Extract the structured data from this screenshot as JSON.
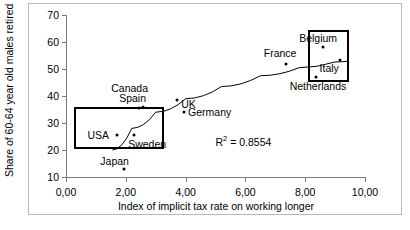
{
  "chart_data": {
    "type": "scatter",
    "title": "",
    "xlabel": "Index of implicit tax rate on working longer",
    "ylabel": "Share of 60-64 year old males retired",
    "xlim": [
      0,
      10
    ],
    "ylim": [
      10,
      70
    ],
    "xticks": [
      "0,00",
      "2,00",
      "4,00",
      "6,00",
      "8,00",
      "10,00"
    ],
    "xtick_values": [
      0,
      2,
      4,
      6,
      8,
      10
    ],
    "yticks": [
      "10",
      "20",
      "30",
      "40",
      "50",
      "60",
      "70"
    ],
    "ytick_values": [
      10,
      20,
      30,
      40,
      50,
      60,
      70
    ],
    "grid": false,
    "legend": "none",
    "annotations": [
      {
        "name": "r-squared",
        "text": "R",
        "sup": "2",
        "rest": " = 0.8554",
        "x": 5.0,
        "y": 26.0
      }
    ],
    "points": [
      {
        "label": "Japan",
        "x": 1.95,
        "y": 13.0,
        "label_pos": "above-left",
        "label_dx": -24,
        "label_dy": -14
      },
      {
        "label": "USA",
        "x": 1.72,
        "y": 25.5,
        "label_pos": "left",
        "label_dx": -30,
        "label_dy": -6
      },
      {
        "label": "Sweden",
        "x": 2.28,
        "y": 25.5,
        "label_pos": "below-right",
        "label_dx": -6,
        "label_dy": 3
      },
      {
        "label": "Canada",
        "x": 2.45,
        "y": 35.5,
        "label_pos": "above",
        "label_dx": -28,
        "label_dy": -26
      },
      {
        "label": "Spain",
        "x": 2.58,
        "y": 36.0,
        "label_pos": "above",
        "label_dx": -24,
        "label_dy": -15
      },
      {
        "label": "UK",
        "x": 3.72,
        "y": 38.5,
        "label_pos": "below-right",
        "label_dx": 4,
        "label_dy": -2
      },
      {
        "label": "Germany",
        "x": 3.95,
        "y": 34.0,
        "label_pos": "right",
        "label_dx": 4,
        "label_dy": -6
      },
      {
        "label": "France",
        "x": 7.35,
        "y": 52.0,
        "label_pos": "above",
        "label_dx": -22,
        "label_dy": -17
      },
      {
        "label": "Netherlands",
        "x": 8.35,
        "y": 47.0,
        "label_pos": "below",
        "label_dx": -26,
        "label_dy": 3
      },
      {
        "label": "Belgium",
        "x": 8.6,
        "y": 58.0,
        "label_pos": "above",
        "label_dx": -24,
        "label_dy": -15
      },
      {
        "label": "Italy",
        "x": 9.15,
        "y": 53.5,
        "label_pos": "below-right",
        "label_dx": -20,
        "label_dy": 2
      }
    ],
    "trendline": {
      "type": "logarithmic",
      "description": "fitted curve rising and flattening from lower-left to upper-right",
      "r_squared": 0.8554,
      "path_points": [
        {
          "x": 1.55,
          "y": 20.0
        },
        {
          "x": 2.2,
          "y": 28.0
        },
        {
          "x": 3.0,
          "y": 34.0
        },
        {
          "x": 4.0,
          "y": 39.0
        },
        {
          "x": 5.2,
          "y": 43.5
        },
        {
          "x": 6.5,
          "y": 47.5
        },
        {
          "x": 7.8,
          "y": 50.5
        },
        {
          "x": 9.0,
          "y": 52.6
        },
        {
          "x": 9.45,
          "y": 52.9
        }
      ]
    },
    "highlight_boxes": [
      {
        "name": "low-tax-low-retirement-group",
        "x0": 0.28,
        "x1": 3.28,
        "y0": 20.4,
        "y1": 35.8,
        "members": [
          "USA",
          "Sweden",
          "Japan"
        ]
      },
      {
        "name": "high-tax-high-retirement-group",
        "x0": 8.1,
        "x1": 9.45,
        "y0": 45.3,
        "y1": 64.5,
        "members": [
          "Belgium",
          "Italy",
          "Netherlands"
        ]
      }
    ]
  }
}
